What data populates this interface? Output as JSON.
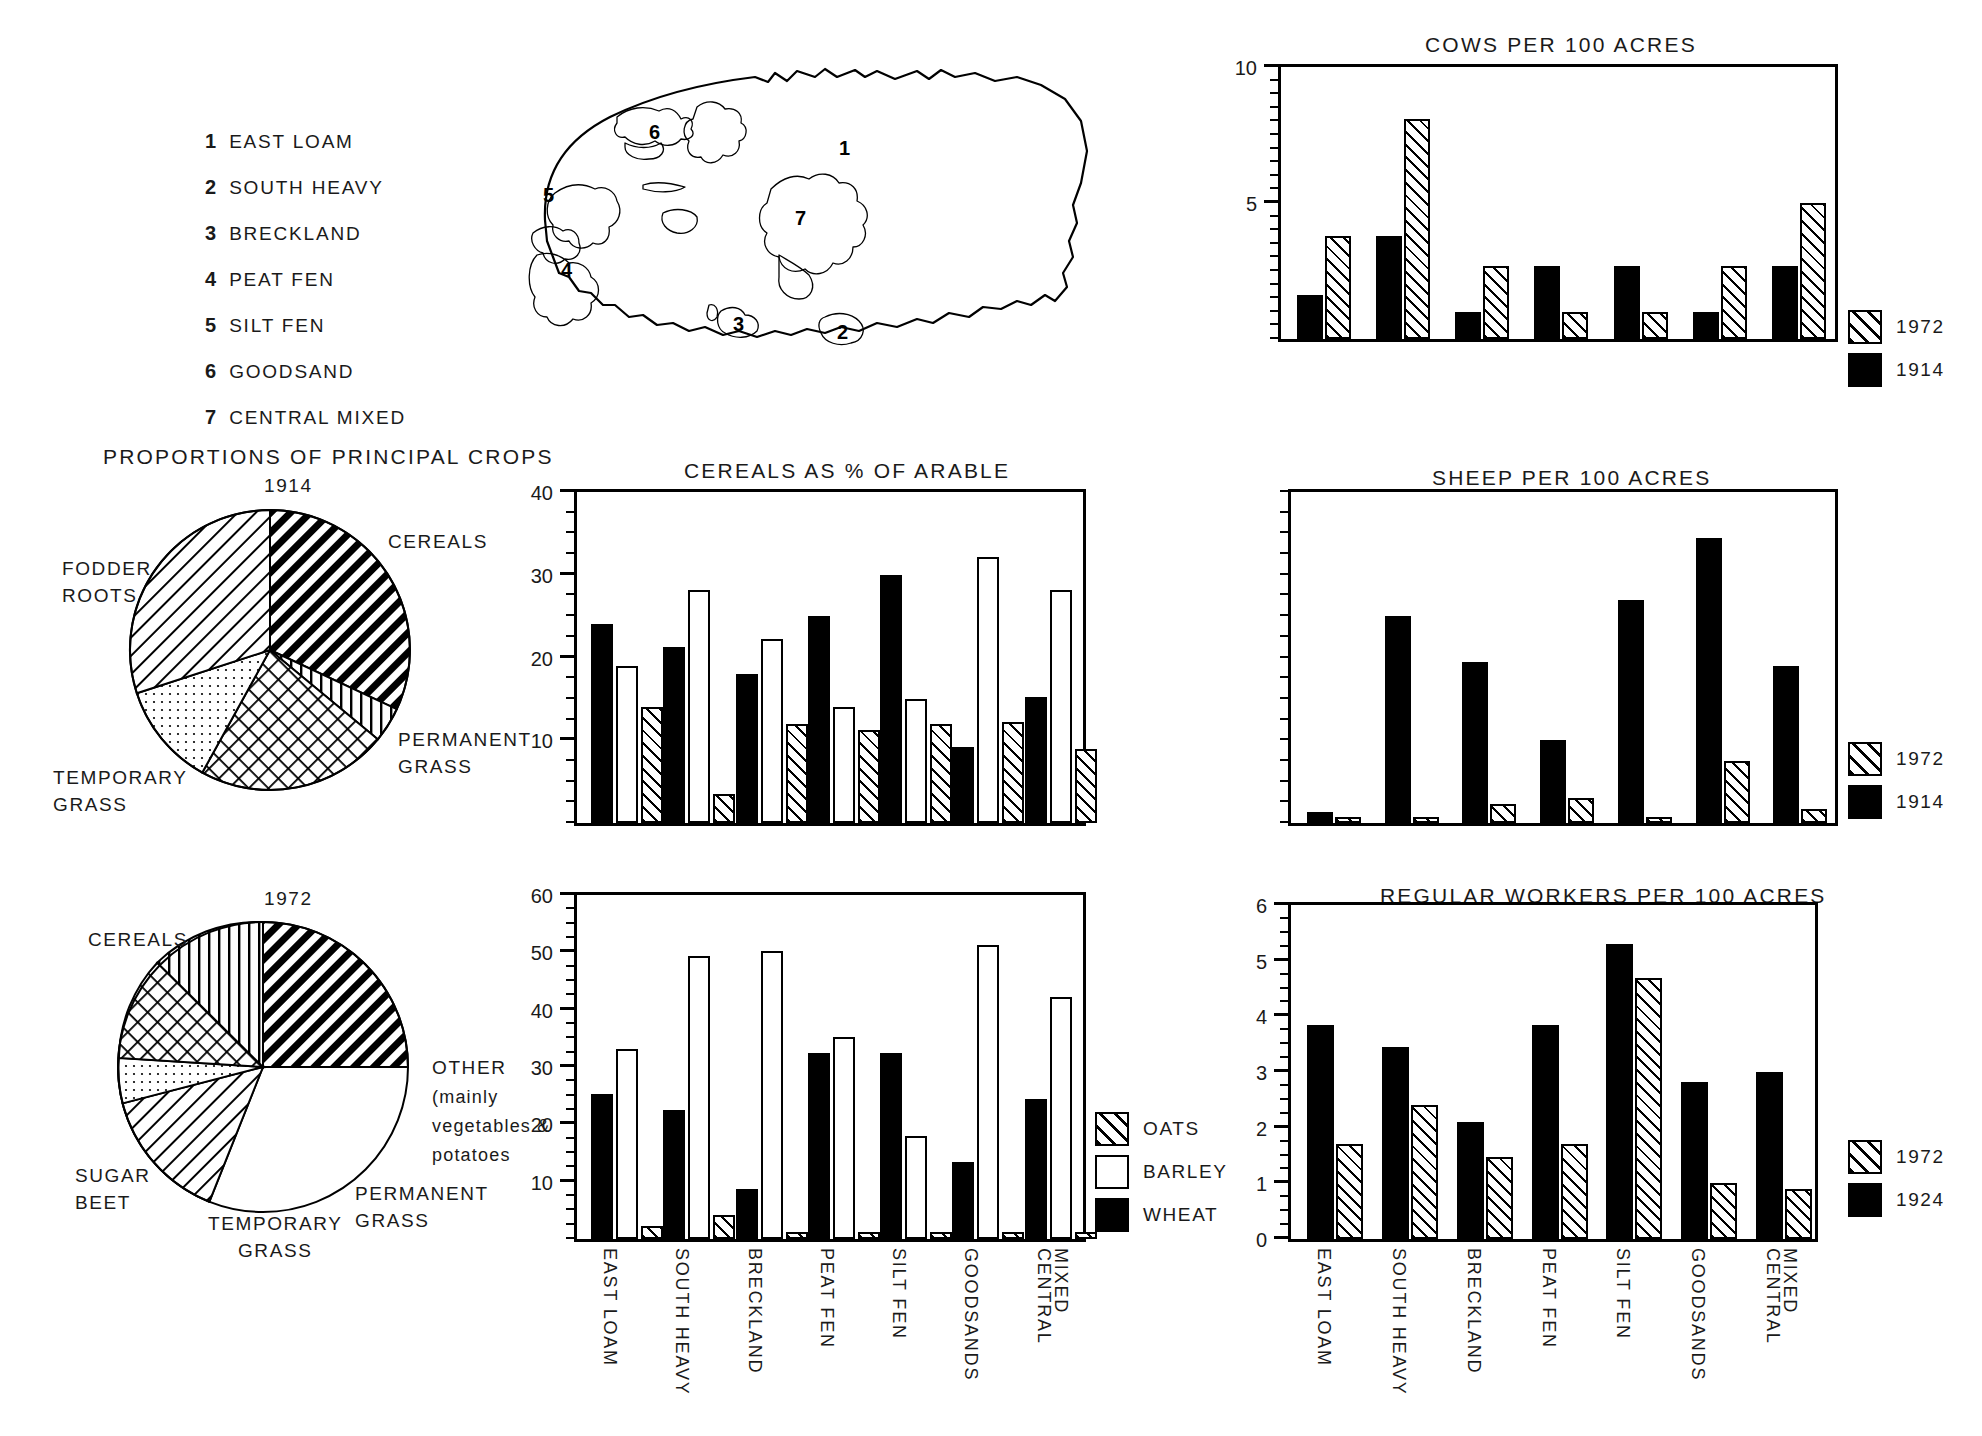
{
  "regions_key": {
    "items": [
      {
        "num": "1",
        "label": "EAST LOAM"
      },
      {
        "num": "2",
        "label": "SOUTH HEAVY"
      },
      {
        "num": "3",
        "label": "BRECKLAND"
      },
      {
        "num": "4",
        "label": "PEAT FEN"
      },
      {
        "num": "5",
        "label": "SILT FEN"
      },
      {
        "num": "6",
        "label": "GOODSAND"
      },
      {
        "num": "7",
        "label": "CENTRAL MIXED"
      }
    ]
  },
  "map": {
    "region_numbers": [
      "1",
      "2",
      "3",
      "4",
      "5",
      "6",
      "7"
    ]
  },
  "pies": {
    "title": "PROPORTIONS OF PRINCIPAL CROPS",
    "charts": [
      {
        "year": "1914",
        "labels": {
          "cereals": "CEREALS",
          "fodder_roots": "FODDER\nROOTS",
          "temporary_grass": "TEMPORARY\nGRASS",
          "permanent_grass": "PERMANENT\nGRASS"
        }
      },
      {
        "year": "1972",
        "labels": {
          "cereals": "CEREALS",
          "sugar_beet": "SUGAR\nBEET",
          "temporary_grass": "TEMPORARY\nGRASS",
          "permanent_grass": "PERMANENT\nGRASS",
          "other": "OTHER\n(mainly\nvegetables &\npotatoes"
        }
      }
    ]
  },
  "cereals": {
    "title": "CEREALS AS % OF ARABLE",
    "legend": [
      {
        "key": "OATS",
        "fill": "hatch"
      },
      {
        "key": "BARLEY",
        "fill": "white"
      },
      {
        "key": "WHEAT",
        "fill": "black"
      }
    ],
    "categories": [
      "EAST LOAM",
      "SOUTH HEAVY",
      "BRECKLAND",
      "PEAT FEN",
      "SILT FEN",
      "GOODSANDS",
      "CENTRAL MIXED"
    ]
  },
  "livestock": {
    "cows_title": "COWS PER 100 ACRES",
    "sheep_title": "SHEEP PER 100 ACRES",
    "workers_title": "REGULAR WORKERS PER 100 ACRES",
    "legend_1972": "1972",
    "legend_1914": "1914",
    "legend_1924": "1924"
  },
  "chart_data": [
    {
      "type": "pie",
      "title": "PROPORTIONS OF PRINCIPAL CROPS",
      "subtitle": "1914",
      "slices": [
        {
          "label": "CEREALS",
          "value": 32.0,
          "pattern": "diagonal-heavy"
        },
        {
          "label": "OTHER",
          "value": 4.0,
          "pattern": "vertical-lines"
        },
        {
          "label": "PERMANENT GRASS",
          "value": 22.0,
          "pattern": "crosshatch"
        },
        {
          "label": "TEMPORARY GRASS",
          "value": 12.0,
          "pattern": "dots"
        },
        {
          "label": "FODDER ROOTS",
          "value": 30.0,
          "pattern": "diagonal-light"
        }
      ]
    },
    {
      "type": "pie",
      "title": "PROPORTIONS OF PRINCIPAL CROPS",
      "subtitle": "1972",
      "slices": [
        {
          "label": "CEREALS",
          "value": 56.0,
          "pattern": "diagonal-heavy"
        },
        {
          "label": "SUGAR BEET",
          "value": 15.0,
          "pattern": "diagonal-light"
        },
        {
          "label": "TEMPORARY GRASS",
          "value": 5.0,
          "pattern": "dots"
        },
        {
          "label": "PERMANENT GRASS",
          "value": 11.0,
          "pattern": "crosshatch"
        },
        {
          "label": "OTHER (mainly vegetables & potatoes)",
          "value": 13.0,
          "pattern": "vertical-lines"
        }
      ]
    },
    {
      "type": "bar",
      "title": "CEREALS AS % OF ARABLE",
      "subtitle": "1914",
      "ylabel": "",
      "ylim": [
        0,
        40
      ],
      "yticks": [
        10,
        20,
        30,
        40
      ],
      "categories": [
        "EAST LOAM",
        "SOUTH HEAVY",
        "BRECKLAND",
        "PEAT FEN",
        "SILT FEN",
        "GOODSANDS",
        "CENTRAL MIXED"
      ],
      "series": [
        {
          "name": "WHEAT",
          "fill": "black",
          "values": [
            24.0,
            21.3,
            18.0,
            25.0,
            30.0,
            9.2,
            15.2
          ]
        },
        {
          "name": "BARLEY",
          "fill": "white",
          "values": [
            19.0,
            28.2,
            22.2,
            14.0,
            15.0,
            32.2,
            28.2
          ]
        },
        {
          "name": "OATS",
          "fill": "hatch",
          "values": [
            14.0,
            3.5,
            12.0,
            11.3,
            12.0,
            12.2,
            9.0
          ]
        }
      ]
    },
    {
      "type": "bar",
      "title": "CEREALS AS % OF ARABLE",
      "subtitle": "1972",
      "ylabel": "",
      "ylim": [
        0,
        60
      ],
      "yticks": [
        10,
        20,
        30,
        40,
        50,
        60
      ],
      "categories": [
        "EAST LOAM",
        "SOUTH HEAVY",
        "BRECKLAND",
        "PEAT FEN",
        "SILT FEN",
        "GOODSANDS",
        "CENTRAL MIXED"
      ],
      "series": [
        {
          "name": "WHEAT",
          "fill": "black",
          "values": [
            25.3,
            22.5,
            8.7,
            32.5,
            32.5,
            13.4,
            24.5
          ]
        },
        {
          "name": "BARLEY",
          "fill": "white",
          "values": [
            33.2,
            49.3,
            50.3,
            35.2,
            18.0,
            51.2,
            42.2
          ]
        },
        {
          "name": "OATS",
          "fill": "hatch",
          "values": [
            2.2,
            4.2,
            1.3,
            1.3,
            1.3,
            1.3,
            1.3
          ]
        }
      ]
    },
    {
      "type": "bar",
      "title": "COWS PER 100 ACRES",
      "ylabel": "",
      "ylim": [
        0,
        10
      ],
      "yticks": [
        5,
        10
      ],
      "categories": [
        "EAST LOAM",
        "SOUTH HEAVY",
        "BRECKLAND",
        "PEAT FEN",
        "SILT FEN",
        "GOODSANDS",
        "CENTRAL MIXED"
      ],
      "series": [
        {
          "name": "1914",
          "fill": "black",
          "values": [
            1.6,
            3.8,
            1.0,
            2.7,
            2.7,
            1.0,
            2.7
          ]
        },
        {
          "name": "1972",
          "fill": "hatch",
          "values": [
            3.8,
            8.1,
            2.7,
            1.0,
            1.0,
            2.7,
            5.0
          ]
        }
      ]
    },
    {
      "type": "bar",
      "title": "SHEEP PER 100 ACRES",
      "ylabel": "",
      "ylim": [
        0,
        40
      ],
      "yticks": [],
      "categories": [
        "EAST LOAM",
        "SOUTH HEAVY",
        "BRECKLAND",
        "PEAT FEN",
        "SILT FEN",
        "GOODSANDS",
        "CENTRAL MIXED"
      ],
      "series": [
        {
          "name": "1914",
          "fill": "black",
          "values": [
            1.3,
            25.0,
            19.5,
            10.0,
            27.0,
            34.5,
            19.0
          ]
        },
        {
          "name": "1972",
          "fill": "hatch",
          "values": [
            0.7,
            0.7,
            2.3,
            3.0,
            0.7,
            7.5,
            1.7
          ]
        }
      ]
    },
    {
      "type": "bar",
      "title": "REGULAR WORKERS PER 100 ACRES",
      "ylabel": "",
      "ylim": [
        0,
        6
      ],
      "yticks": [
        0,
        1,
        2,
        3,
        4,
        5,
        6
      ],
      "categories": [
        "EAST LOAM",
        "SOUTH HEAVY",
        "BRECKLAND",
        "PEAT FEN",
        "SILT FEN",
        "GOODSANDS",
        "CENTRAL MIXED"
      ],
      "series": [
        {
          "name": "1924",
          "fill": "black",
          "values": [
            3.85,
            3.45,
            2.1,
            3.85,
            5.3,
            2.82,
            3.0
          ]
        },
        {
          "name": "1972",
          "fill": "hatch",
          "values": [
            1.7,
            2.4,
            1.48,
            1.7,
            4.68,
            1.0,
            0.9
          ]
        }
      ]
    }
  ]
}
